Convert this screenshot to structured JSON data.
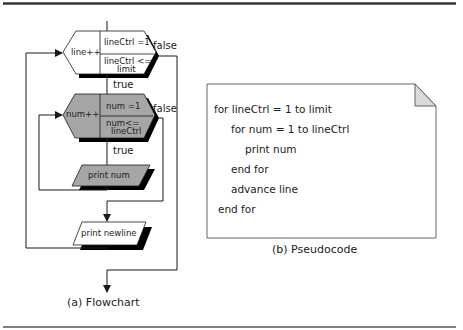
{
  "flowchart": {
    "caption": "(a) Flowchart",
    "outer_loop": {
      "increment": "line++",
      "init": "lineCtrl =1",
      "condition": "lineCtrl <= limit",
      "condition_line1": "lineCtrl <=",
      "condition_line2": "limit",
      "true_label": "true",
      "false_label": "false"
    },
    "inner_loop": {
      "increment": "num++",
      "init": "num =1",
      "condition": "num<= lineCtrl",
      "condition_line1": "num<=",
      "condition_line2": "lineCtrl",
      "true_label": "true",
      "false_label": "false"
    },
    "inner_body": "print  num",
    "outer_body": "print newline"
  },
  "pseudocode": {
    "caption": "(b) Pseudocode",
    "lines": [
      {
        "indent": 0,
        "text": "for lineCtrl = 1 to limit"
      },
      {
        "indent": 1,
        "text": "for num = 1 to lineCtrl"
      },
      {
        "indent": 2,
        "text": "print  num"
      },
      {
        "indent": 1,
        "text": "end for"
      },
      {
        "indent": 1,
        "text": "advance line"
      },
      {
        "indent": 0,
        "text": "end for"
      }
    ]
  },
  "colors": {
    "gray_fill": "#a6a6a6",
    "fold_fill": "#d9d9d9",
    "line": "#1a1a1a"
  }
}
